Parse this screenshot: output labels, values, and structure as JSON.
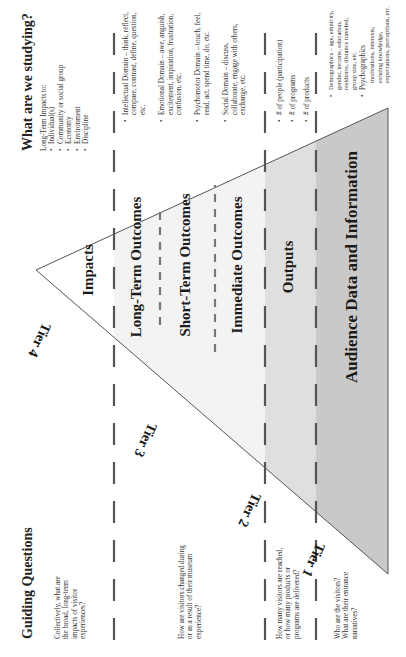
{
  "headers": {
    "left": "Guiding Questions",
    "right": "What are we studying?"
  },
  "tiers": [
    {
      "label": "Tier 4"
    },
    {
      "label": "Tier 3"
    },
    {
      "label": "Tier 2"
    },
    {
      "label": "Tier 1"
    }
  ],
  "levels": {
    "impacts": "Impacts",
    "long_term": "Long-Term Outcomes",
    "short_term": "Short-Term Outcomes",
    "immediate": "Immediate Outcomes",
    "outputs": "Outputs",
    "audience": "Audience Data and Information"
  },
  "questions": {
    "tier4": "Collectively, what are the broad, long-term impacts of visitor experiences?",
    "tier3": "How are visitors changed during or as a result of their museum experience?",
    "tier2": "How many visitors are reached, or how many products or programs are delivered?",
    "tier1": "Who are the visitors? What are their entrance narratives?"
  },
  "studying": {
    "tier4": {
      "intro": "Long-Term Impacts to:",
      "items": [
        "Individual(s)",
        "Community or social group",
        "Economy",
        "Environment",
        "Discipline"
      ]
    },
    "tier3": {
      "items": [
        "Intellectual Domain – think, reflect, compare, contrast, define, question, etc.",
        "Emotional Domain – awe, anguish, excitement, inspiration, frustration, confusion, etc.",
        "Psychomotor Domain – touch, feel, read, act, spend time, do, etc.",
        "Social Domain – discuss, collaborate, engage with others, exchange, etc."
      ]
    },
    "tier2": {
      "items": [
        "# of people (participation)",
        "# of programs",
        "# of products"
      ]
    },
    "tier1": {
      "items": [
        "Demographics – age, ethnicity, gender, income, education, residence, distance traveled, group size, etc.",
        "Psychographics"
      ],
      "psychographics_detail": "motivations, interests, existing knowledge, expectations, perceptions, etc."
    }
  },
  "colors": {
    "outcomes_band": "#f3f3f3",
    "outputs_band": "#dfdfdf",
    "audience_band": "#c9c9c9",
    "dash": "#555555",
    "outline": "#555555"
  }
}
